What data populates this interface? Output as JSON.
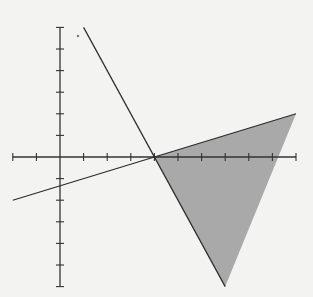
{
  "diagram": {
    "type": "coordinate-plane-feasible-region",
    "colors": {
      "background": "#f3f3f1",
      "axis": "#333333",
      "line": "#2a2a2a",
      "shade": "#a9a9a9"
    },
    "axes": {
      "origin_px": [
        60,
        157
      ],
      "unit_px": [
        23.6,
        21.6
      ],
      "x_range": [
        -2,
        10
      ],
      "y_range": [
        -6,
        6
      ],
      "tick_step": 1,
      "labels": []
    },
    "lines": [
      {
        "name": "line-1",
        "equation": "y = -2x + 8",
        "from": [
          1,
          6
        ],
        "to": [
          7,
          -6
        ]
      },
      {
        "name": "line-2",
        "equation": "y = (x - 4) / 3",
        "from": [
          -2,
          -2
        ],
        "to": [
          10,
          2
        ]
      }
    ],
    "shaded_region": {
      "vertices": [
        [
          4,
          0
        ],
        [
          10,
          2
        ],
        [
          7,
          -6
        ]
      ]
    },
    "dot": {
      "px": [
        78,
        36
      ]
    }
  }
}
